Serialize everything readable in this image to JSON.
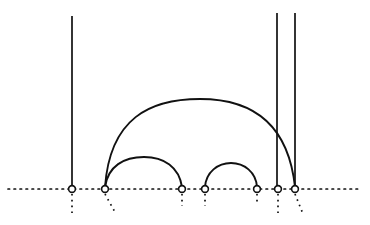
{
  "figure": {
    "width": 370,
    "height": 225,
    "background_color": "#ffffff",
    "stroke_color": "#111111"
  },
  "baseline": {
    "name": "dotted-baseline",
    "y": 189,
    "x_start": 8,
    "x_end": 358,
    "style": "dotted",
    "dash_pattern": "1.6 4.4",
    "stroke_width": 1.7,
    "color": "#111111"
  },
  "nodes": [
    {
      "id": "n1",
      "label": "1",
      "x": 72,
      "y": 189,
      "radius": 3.4
    },
    {
      "id": "n2",
      "label": "2",
      "x": 105,
      "y": 189,
      "radius": 3.4
    },
    {
      "id": "n3",
      "label": "3",
      "x": 182,
      "y": 189,
      "radius": 3.4
    },
    {
      "id": "n4",
      "label": "4",
      "x": 205,
      "y": 189,
      "radius": 3.4
    },
    {
      "id": "n5",
      "label": "5",
      "x": 257,
      "y": 189,
      "radius": 3.4
    },
    {
      "id": "n6",
      "label": "6",
      "x": 278,
      "y": 189,
      "radius": 3.4
    },
    {
      "id": "n7",
      "label": "7",
      "x": 295,
      "y": 189,
      "radius": 3.4
    }
  ],
  "stems": [
    {
      "id": "s1",
      "label": "stem-node-1",
      "x": 72,
      "y_top": 16,
      "y_bottom": 186,
      "stroke_width": 1.7
    },
    {
      "id": "s2",
      "label": "stem-node-6",
      "x": 277,
      "y_top": 13,
      "y_bottom": 186,
      "stroke_width": 1.7
    },
    {
      "id": "s3",
      "label": "stem-node-7",
      "x": 295,
      "y_top": 13,
      "y_bottom": 186,
      "stroke_width": 1.7
    }
  ],
  "arcs": [
    {
      "id": "a1",
      "label": "arc-node2-to-node7",
      "from_x": 105,
      "to_x": 295,
      "apex_y": 99,
      "baseline_y": 187,
      "path": "M 105 187 C 110 118, 150 99, 200 99 C 250 99, 288 122, 295 187",
      "stroke_width": 1.9
    },
    {
      "id": "a2",
      "label": "arc-node2-to-node3",
      "from_x": 105,
      "to_x": 182,
      "apex_y": 157,
      "baseline_y": 187,
      "path": "M 105 187 C 108 166, 124 157, 144 157 C 164 157, 179 167, 182 187",
      "stroke_width": 1.9
    },
    {
      "id": "a3",
      "label": "arc-node4-to-node5",
      "from_x": 205,
      "to_x": 257,
      "apex_y": 163,
      "baseline_y": 187,
      "path": "M 205 187 C 206 172, 218 163, 231 163 C 244 163, 256 172, 257 187",
      "stroke_width": 1.9
    }
  ],
  "descenders": [
    {
      "id": "d1",
      "label": "descender-node-1",
      "x1": 72,
      "y1": 194,
      "x2": 72,
      "y2": 215,
      "direction": "vertical",
      "dash_pattern": "1.6 4.2",
      "stroke_width": 1.7
    },
    {
      "id": "d2",
      "label": "descender-node-2",
      "x1": 105,
      "y1": 194,
      "x2": 116,
      "y2": 214,
      "direction": "diagonal-right",
      "dash_pattern": "1.6 4.2",
      "stroke_width": 1.7
    },
    {
      "id": "d3",
      "label": "descender-node-3",
      "x1": 182,
      "y1": 194,
      "x2": 182,
      "y2": 206,
      "direction": "vertical",
      "dash_pattern": "1.6 4.2",
      "stroke_width": 1.7
    },
    {
      "id": "d4",
      "label": "descender-node-4",
      "x1": 205,
      "y1": 194,
      "x2": 205,
      "y2": 206,
      "direction": "vertical",
      "dash_pattern": "1.6 4.2",
      "stroke_width": 1.7
    },
    {
      "id": "d5",
      "label": "descender-node-5",
      "x1": 257,
      "y1": 194,
      "x2": 257,
      "y2": 202,
      "direction": "vertical",
      "dash_pattern": "1.6 4.2",
      "stroke_width": 1.7
    },
    {
      "id": "d6",
      "label": "descender-node-6",
      "x1": 278,
      "y1": 194,
      "x2": 278,
      "y2": 215,
      "direction": "vertical",
      "dash_pattern": "1.6 4.2",
      "stroke_width": 1.7
    },
    {
      "id": "d7",
      "label": "descender-node-7",
      "x1": 295,
      "y1": 194,
      "x2": 303,
      "y2": 214,
      "direction": "diagonal-right",
      "dash_pattern": "1.6 4.2",
      "stroke_width": 1.7
    }
  ]
}
